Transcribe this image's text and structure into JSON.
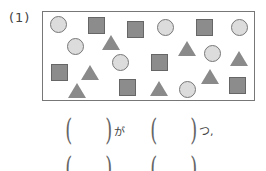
{
  "problem": {
    "number_label": "(1)",
    "shapes": [
      {
        "type": "circle",
        "x": 58,
        "y": 24
      },
      {
        "type": "circle",
        "x": 75,
        "y": 46
      },
      {
        "type": "circle",
        "x": 120,
        "y": 62
      },
      {
        "type": "circle",
        "x": 165,
        "y": 27
      },
      {
        "type": "circle",
        "x": 212,
        "y": 53
      },
      {
        "type": "circle",
        "x": 239,
        "y": 27
      },
      {
        "type": "circle",
        "x": 187,
        "y": 89
      },
      {
        "type": "square",
        "x": 96,
        "y": 25
      },
      {
        "type": "square",
        "x": 135,
        "y": 29
      },
      {
        "type": "square",
        "x": 204,
        "y": 27
      },
      {
        "type": "square",
        "x": 59,
        "y": 72
      },
      {
        "type": "square",
        "x": 159,
        "y": 62
      },
      {
        "type": "square",
        "x": 127,
        "y": 87
      },
      {
        "type": "square",
        "x": 237,
        "y": 85
      },
      {
        "type": "triangle",
        "x": 111,
        "y": 43
      },
      {
        "type": "triangle",
        "x": 187,
        "y": 49
      },
      {
        "type": "triangle",
        "x": 239,
        "y": 59
      },
      {
        "type": "triangle",
        "x": 90,
        "y": 73
      },
      {
        "type": "triangle",
        "x": 210,
        "y": 77
      },
      {
        "type": "triangle",
        "x": 77,
        "y": 91
      },
      {
        "type": "triangle",
        "x": 159,
        "y": 89
      }
    ],
    "answer_row_1": {
      "particle": "が",
      "counter": "つ,"
    },
    "colors": {
      "circle_fill": "#dcdcdc",
      "square_fill": "#8c8c8c",
      "triangle_fill": "#8a8a8a",
      "border": "#777777"
    }
  }
}
